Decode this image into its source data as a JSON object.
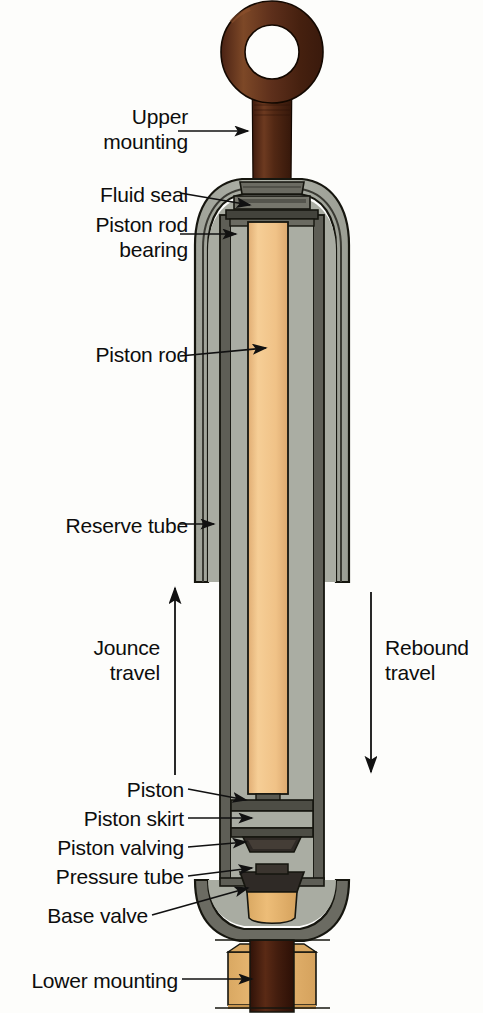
{
  "diagram": {
    "background_color": "#fdfdfb",
    "labels": [
      {
        "id": "upper-mounting",
        "text": "Upper\nmounting",
        "align": "right",
        "x": 8,
        "y": 104,
        "width": 180
      },
      {
        "id": "fluid-seal",
        "text": "Fluid seal",
        "align": "right",
        "x": 8,
        "y": 182,
        "width": 180
      },
      {
        "id": "piston-rod-bearing",
        "text": "Piston rod\nbearing",
        "align": "right",
        "x": 8,
        "y": 212,
        "width": 180
      },
      {
        "id": "piston-rod",
        "text": "Piston rod",
        "align": "right",
        "x": 8,
        "y": 342,
        "width": 180
      },
      {
        "id": "reserve-tube",
        "text": "Reserve tube",
        "align": "right",
        "x": 8,
        "y": 513,
        "width": 180
      },
      {
        "id": "jounce-travel",
        "text": "Jounce\ntravel",
        "align": "right",
        "x": 8,
        "y": 635,
        "width": 152
      },
      {
        "id": "rebound-travel",
        "text": "Rebound\ntravel",
        "align": "left",
        "x": 385,
        "y": 635,
        "width": 98
      },
      {
        "id": "piston",
        "text": "Piston",
        "align": "right",
        "x": 8,
        "y": 777,
        "width": 176
      },
      {
        "id": "piston-skirt",
        "text": "Piston skirt",
        "align": "right",
        "x": 8,
        "y": 806,
        "width": 176
      },
      {
        "id": "piston-valving",
        "text": "Piston valving",
        "align": "right",
        "x": 8,
        "y": 835,
        "width": 176
      },
      {
        "id": "pressure-tube",
        "text": "Pressure tube",
        "align": "right",
        "x": 8,
        "y": 864,
        "width": 176
      },
      {
        "id": "base-valve",
        "text": "Base valve",
        "align": "right",
        "x": 8,
        "y": 903,
        "width": 140
      },
      {
        "id": "lower-mounting",
        "text": "Lower mounting",
        "align": "right",
        "x": 0,
        "y": 968,
        "width": 178
      }
    ],
    "colors": {
      "mounting_brown_dark": "#3c1b10",
      "mounting_brown_mid": "#5e2e1a",
      "mounting_brown_light": "#7a4427",
      "bushing_tan": "#e8b76d",
      "rod_tan": "#f2c78e",
      "fluid_gray": "#a8aba1",
      "metal_dark": "#4a4a45",
      "metal_mid": "#6e6e66",
      "outline": "#16160f",
      "leader_line": "#111111"
    },
    "parts": [
      "upper mounting eye",
      "fluid seal",
      "piston rod bearing",
      "piston rod",
      "reserve tube",
      "pressure tube",
      "piston",
      "piston skirt",
      "piston valving",
      "base valve",
      "lower mounting"
    ],
    "travel_arrows": [
      {
        "id": "jounce-arrow",
        "direction": "up",
        "x": 175,
        "y_top": 585,
        "y_bottom": 775
      },
      {
        "id": "rebound-arrow",
        "direction": "down",
        "x": 371,
        "y_top": 592,
        "y_bottom": 776
      }
    ]
  }
}
